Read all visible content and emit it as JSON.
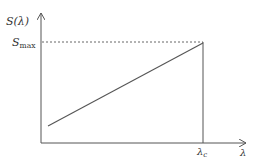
{
  "diagram": {
    "y_axis_label": "S(λ)",
    "y_marker": {
      "symbol": "S",
      "subscript": "max"
    },
    "x_axis_label": "λ",
    "x_marker": {
      "symbol": "λ",
      "subscript": "c"
    },
    "line_color": "#555555",
    "dash_color": "#666666"
  }
}
